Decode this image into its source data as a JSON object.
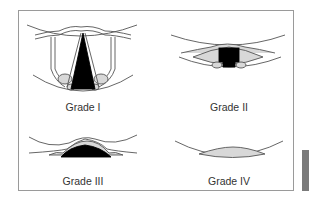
{
  "figure": {
    "panels": [
      {
        "id": "grade-1",
        "label": "Grade I",
        "view": "Full glottis visible: epiglottis, arytenoids, vocal cords and open glottic opening"
      },
      {
        "id": "grade-2",
        "label": "Grade II",
        "view": "Partial glottis visible: posterior glottis and arytenoids"
      },
      {
        "id": "grade-3",
        "label": "Grade III",
        "view": "Only epiglottis visible"
      },
      {
        "id": "grade-4",
        "label": "Grade IV",
        "view": "Only soft palate visible, no epiglottis"
      }
    ]
  },
  "colors": {
    "line": "#555555",
    "fill_light": "#d8d8d8",
    "fill_dark": "#000000",
    "frame": "#9a9a9a",
    "side_tab": "#7a7a7a"
  }
}
